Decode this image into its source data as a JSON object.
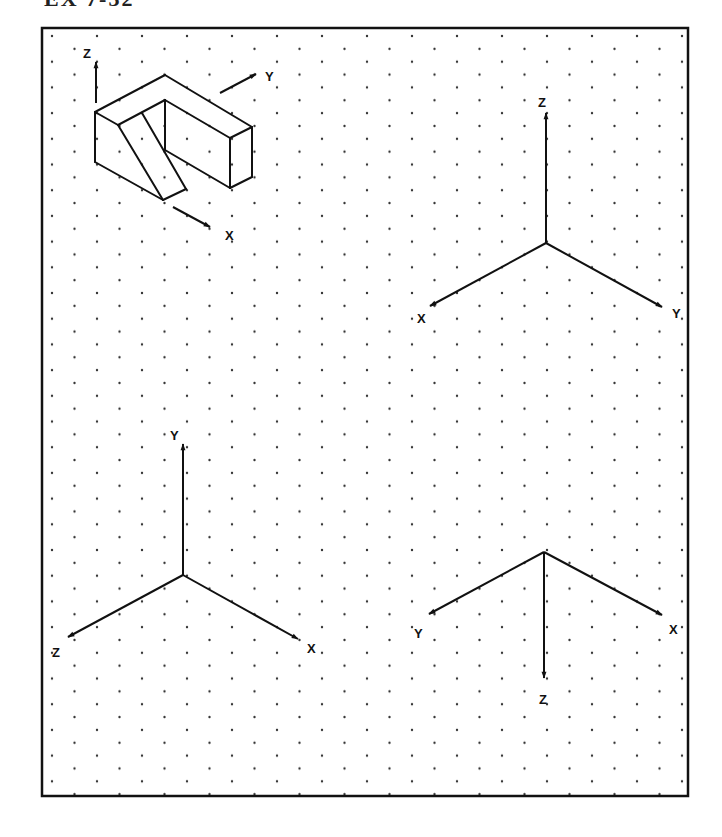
{
  "heading": "EX 7-32",
  "colors": {
    "line": "#111111",
    "dot": "#333333",
    "background": "#ffffff"
  },
  "worksheet": {
    "grid": "isometric-dot-grid",
    "object_view": {
      "description": "Isometric view of a U-shaped (notched) block with a slanted strip on the front-left face",
      "axes": {
        "z_label": "Z",
        "y_label": "Y",
        "x_label": "X"
      }
    },
    "axis_set_top_right": {
      "up_label": "Z",
      "left_label": "X",
      "right_label": "Y"
    },
    "axis_set_bottom_left": {
      "up_label": "Y",
      "left_label": "Z",
      "right_label": "X"
    },
    "axis_set_bottom_right": {
      "down_label": "Z",
      "left_label": "Y",
      "right_label": "X"
    }
  }
}
